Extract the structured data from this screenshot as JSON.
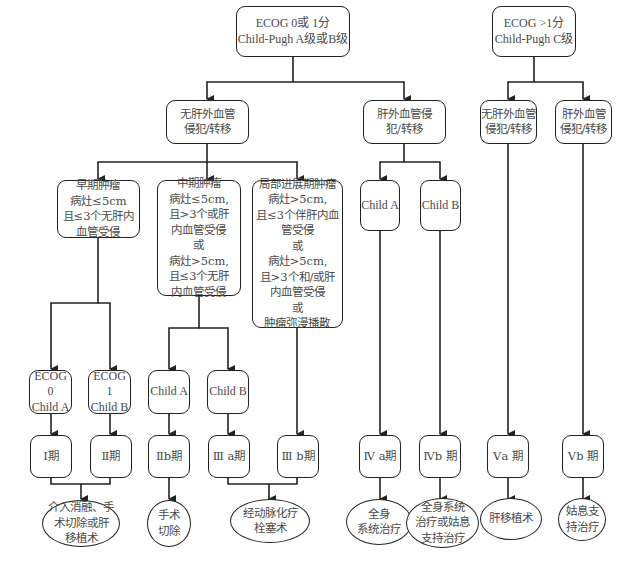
{
  "diagram": {
    "top": {
      "left": "ECOG 0或 1分\nChild-Pugh A级或B级",
      "right": "ECOG >1分\nChild-Pugh C级"
    },
    "level2": {
      "no_extrahepatic_left": "无肝外血管\n侵犯/转移",
      "extrahepatic_left": "肝外血管侵\n犯/转移",
      "no_extrahepatic_right": "无肝外血管\n侵犯/转移",
      "extrahepatic_right": "肝外血管\n侵犯/转移"
    },
    "level3": {
      "early": "早期肿瘤\n病灶≤5cm\n且≤3个无肝内\n血管受侵",
      "intermediate": "中期肿瘤\n病灶≤5cm,\n且>3个或肝\n内血管受侵\n或\n病灶>5cm,\n且≤3个无肝\n内血管受侵",
      "locally_advanced": "局部进展期肿瘤\n病灶>5cm,\n且≤3个伴肝内血\n管受侵\n或\n病灶>5cm,\n且>3个和/或肝\n内血管受侵\n或\n肿瘤弥漫播散",
      "child_a": "Child A",
      "child_b": "Child B"
    },
    "level4": {
      "ecog0": "ECOG 0\nChild A",
      "ecog1": "ECOG 1\nChild B",
      "child_a": "Child A",
      "child_b": "Child B"
    },
    "stages": {
      "s1": "Ⅰ期",
      "s2": "Ⅱ期",
      "s2b": "Ⅱb期",
      "s3a": "Ⅲ a期",
      "s3b": "Ⅲ b期",
      "s4a": "Ⅳ a期",
      "s4b": "Ⅳb 期",
      "s5a": "Ⅴa 期",
      "s5b": "Ⅴb 期"
    },
    "treatments": {
      "t1": "介入消融、手\n术切除或肝\n移植术",
      "t2": "手术\n切除",
      "t3": "经动脉化疗\n栓塞术",
      "t4": "全身\n系统治疗",
      "t5": "全身系统\n治疗或姑息\n支持治疗",
      "t6": "肝移植术",
      "t7": "姑息支\n持治疗"
    },
    "colors": {
      "line": "#222222",
      "text": "#4a4a4a",
      "background": "#ffffff"
    }
  }
}
